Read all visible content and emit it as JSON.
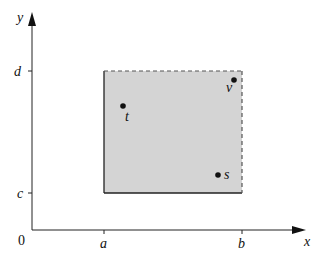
{
  "diagram": {
    "axes": {
      "x_label": "x",
      "y_label": "y",
      "origin_label": "0",
      "x_ticks": [
        "a",
        "b"
      ],
      "y_ticks": [
        "c",
        "d"
      ]
    },
    "region": {
      "fill_color": "#d4d4d4",
      "solid_edges": [
        "left (x=a)",
        "bottom (y=c)"
      ],
      "dashed_edges": [
        "top (y=d)",
        "right (x=b)"
      ]
    },
    "points": [
      {
        "label": "t"
      },
      {
        "label": "v"
      },
      {
        "label": "s"
      }
    ]
  }
}
